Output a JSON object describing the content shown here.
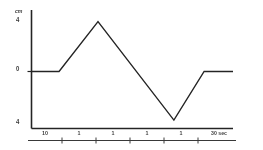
{
  "chart_data": {
    "type": "line",
    "title": "",
    "subtitle": "",
    "xlabel": "sec",
    "ylabel": "cm",
    "xlim": [
      0,
      30
    ],
    "ylim": [
      -4,
      4
    ],
    "grid": false,
    "legend": null,
    "axis": {
      "y_unit_label": "cm",
      "y_ticks": [
        {
          "value": 4,
          "label": "4"
        },
        {
          "value": 0,
          "label": "0"
        },
        {
          "value": -4,
          "label": "4"
        }
      ],
      "x_ticks": [
        {
          "value": 5,
          "label": "10"
        },
        {
          "value": 10,
          "label": "1"
        },
        {
          "value": 15,
          "label": "1"
        },
        {
          "value": 20,
          "label": "1"
        },
        {
          "value": 25,
          "label": "1"
        },
        {
          "value": 30,
          "label": "30 sec"
        }
      ]
    },
    "x": [
      0,
      4.1,
      9.9,
      21.2,
      25.7,
      30
    ],
    "y": [
      0,
      0,
      3.7,
      -3.6,
      0,
      0
    ],
    "series": [
      {
        "name": "displacement",
        "color": "#262626",
        "values": [
          0,
          0,
          3.7,
          -3.6,
          0,
          0
        ]
      }
    ],
    "annotations": []
  },
  "colors": {
    "ink": "#262626",
    "background": "#ffffff"
  }
}
